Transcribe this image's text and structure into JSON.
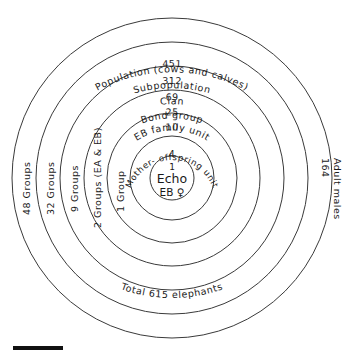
{
  "figure": {
    "type": "concentric-hierarchy-diagram",
    "background_color": "#ffffff",
    "line_color": "#3a3a3a",
    "text_color": "#1a1a1a",
    "center": {
      "x": 172,
      "y": 178
    },
    "outer_radius": 160
  },
  "center_core": {
    "count": "1",
    "name": "Echo",
    "code": "EB ♀"
  },
  "rings": [
    {
      "index": 0,
      "radius": 160,
      "count": "451",
      "label": "Population (cows and calves)",
      "side_label": "48 Groups",
      "side": "left"
    },
    {
      "index": 1,
      "radius": 136,
      "count": "312",
      "label": "Subpopulation",
      "side_label": "32 Groups",
      "side": "left"
    },
    {
      "index": 2,
      "radius": 112,
      "count": "69",
      "label": "Clan",
      "side_label": "9 Groups",
      "side": "left"
    },
    {
      "index": 3,
      "radius": 88,
      "count": "25",
      "label": "Bond group",
      "side_label": "2 Groups (EA & EB)",
      "side": "left"
    },
    {
      "index": 4,
      "radius": 65,
      "count": "10",
      "label": "EB family unit",
      "side_label": "1 Group",
      "side": "left"
    },
    {
      "index": 5,
      "radius": 42,
      "count": "4",
      "label": "Mother- offspring unit",
      "side_label": "",
      "side": "none"
    },
    {
      "index": 6,
      "radius": 22,
      "count": "1",
      "label": "Echo",
      "side_label": "",
      "side": "none"
    }
  ],
  "right_annotation": {
    "count": "164",
    "label": "Adult males"
  },
  "bottom_annotation": {
    "text": "Total 615 elephants"
  },
  "scale_bar": {
    "present": true,
    "label": "",
    "color": "#111111"
  }
}
